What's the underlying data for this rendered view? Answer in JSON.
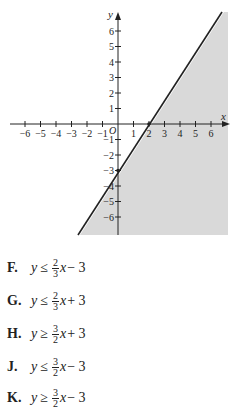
{
  "chart_data": {
    "type": "line",
    "title": "",
    "xlabel": "x",
    "ylabel": "y",
    "origin_label": "O",
    "xlim": [
      -7,
      7
    ],
    "ylim": [
      -7,
      7
    ],
    "x_ticks": [
      -6,
      -5,
      -4,
      -3,
      -2,
      -1,
      1,
      2,
      3,
      4,
      5,
      6
    ],
    "y_ticks": [
      -6,
      -5,
      -4,
      -3,
      -2,
      -1,
      1,
      2,
      3,
      4,
      5,
      6
    ],
    "x_tick_labels": [
      "−6",
      "−5",
      "−4",
      "−3",
      "−2",
      "−1",
      "1",
      "2",
      "3",
      "4",
      "5",
      "6"
    ],
    "y_tick_labels": [
      "−6",
      "−5",
      "−4",
      "−3",
      "−2",
      "−1",
      "1",
      "2",
      "3",
      "4",
      "5",
      "6"
    ],
    "grid": false,
    "series": [
      {
        "name": "boundary line",
        "equation": "y = (3/2)x - 3",
        "style": "solid",
        "points": [
          [
            0,
            -3
          ],
          [
            2,
            0
          ]
        ]
      }
    ],
    "marked_points": [
      [
        0,
        -3
      ],
      [
        2,
        0
      ]
    ],
    "shaded_region": "below/right of line (y <= (3/2)x - 3)",
    "shade_color": "#d9d9d9"
  },
  "graph": {
    "x_axis_label": "x",
    "y_axis_label": "y",
    "origin_label": "O",
    "x_tick_labels": [
      "−6",
      "−5",
      "−4",
      "−3",
      "−2",
      "−1",
      "1",
      "2",
      "3",
      "4",
      "5",
      "6"
    ],
    "y_tick_labels_pos": [
      "6",
      "5",
      "4",
      "3",
      "2",
      "1"
    ],
    "y_tick_labels_neg": [
      "−1",
      "−2",
      "−3",
      "−4",
      "−5",
      "−6"
    ]
  },
  "choices": [
    {
      "letter": "F.",
      "var": "y",
      "rel": "≤",
      "num": "2",
      "den": "3",
      "xvar": "x",
      "rest": " − 3"
    },
    {
      "letter": "G.",
      "var": "y",
      "rel": "≤",
      "num": "2",
      "den": "3",
      "xvar": "x",
      "rest": " + 3"
    },
    {
      "letter": "H.",
      "var": "y",
      "rel": "≥",
      "num": "3",
      "den": "2",
      "xvar": "x",
      "rest": " + 3"
    },
    {
      "letter": "J.",
      "var": "y",
      "rel": "≤",
      "num": "3",
      "den": "2",
      "xvar": "x",
      "rest": " − 3"
    },
    {
      "letter": "K.",
      "var": "y",
      "rel": "≥",
      "num": "3",
      "den": "2",
      "xvar": "x",
      "rest": " − 3"
    }
  ]
}
